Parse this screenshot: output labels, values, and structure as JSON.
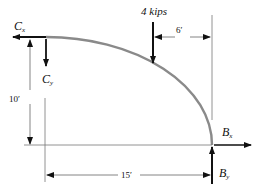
{
  "diagram": {
    "forces": {
      "cx": {
        "label": "C",
        "subscript": "x"
      },
      "cy": {
        "label": "C",
        "subscript": "y"
      },
      "bx": {
        "label": "B",
        "subscript": "x"
      },
      "by": {
        "label": "B",
        "subscript": "y"
      },
      "load": {
        "label": "4 kips"
      }
    },
    "dimensions": {
      "height": "10′",
      "width": "15′",
      "load_offset": "6′"
    },
    "colors": {
      "curve": "#8a8a8a",
      "arrow": "#111111",
      "dimension_line": "#555555"
    }
  }
}
